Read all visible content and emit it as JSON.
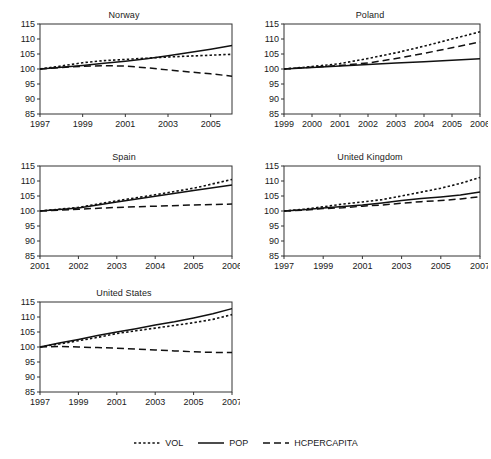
{
  "figure": {
    "width": 491,
    "height": 459,
    "background": "#ffffff",
    "line_color": "#111111",
    "axis_color": "#333333"
  },
  "legend": {
    "position": "bottom-center",
    "entries": [
      {
        "label": "VOL",
        "style": "dotted",
        "name": "legend-vol"
      },
      {
        "label": "POP",
        "style": "solid",
        "name": "legend-pop"
      },
      {
        "label": "HCPERCAPITA",
        "style": "dashed",
        "name": "legend-hcpercapita"
      }
    ]
  },
  "chart_data": {
    "type": "line",
    "title": "",
    "xlabel": "",
    "ylabel": "",
    "ylim": [
      85,
      115
    ],
    "yticks": [
      85,
      90,
      95,
      100,
      105,
      110,
      115
    ],
    "grid": false,
    "legend_position": "bottom-center",
    "panels": [
      {
        "title": "Norway",
        "xlim": [
          1997,
          2006
        ],
        "xticks": [
          1997,
          1999,
          2001,
          2003,
          2005
        ],
        "x": [
          1997,
          1998,
          1999,
          2000,
          2001,
          2002,
          2003,
          2004,
          2005,
          2006
        ],
        "series": [
          {
            "name": "VOL",
            "style": "dotted",
            "values": [
              100.0,
              101.0,
              102.1,
              102.8,
              103.2,
              103.6,
              104.0,
              104.3,
              104.6,
              104.9
            ]
          },
          {
            "name": "POP",
            "style": "solid",
            "values": [
              100.0,
              100.6,
              101.2,
              101.9,
              102.6,
              103.4,
              104.4,
              105.5,
              106.6,
              107.8
            ]
          },
          {
            "name": "HCPERCAPITA",
            "style": "dashed",
            "values": [
              100.0,
              100.5,
              100.9,
              101.1,
              101.0,
              100.4,
              99.7,
              99.0,
              98.4,
              97.6
            ]
          }
        ]
      },
      {
        "title": "Poland",
        "xlim": [
          1999,
          2006
        ],
        "xticks": [
          1999,
          2000,
          2001,
          2002,
          2003,
          2004,
          2005,
          2006
        ],
        "x": [
          1999,
          2000,
          2001,
          2002,
          2003,
          2004,
          2005,
          2006
        ],
        "series": [
          {
            "name": "VOL",
            "style": "dotted",
            "values": [
              100.0,
              100.8,
              101.8,
              103.5,
              105.4,
              107.6,
              110.0,
              112.4
            ]
          },
          {
            "name": "POP",
            "style": "solid",
            "values": [
              100.0,
              100.5,
              101.0,
              101.5,
              102.0,
              102.4,
              102.9,
              103.4
            ]
          },
          {
            "name": "HCPERCAPITA",
            "style": "dashed",
            "values": [
              100.0,
              100.6,
              101.2,
              102.0,
              103.5,
              105.2,
              107.1,
              109.0
            ]
          }
        ]
      },
      {
        "title": "Spain",
        "xlim": [
          2001,
          2006
        ],
        "xticks": [
          2001,
          2002,
          2003,
          2004,
          2005,
          2006
        ],
        "x": [
          2001,
          2002,
          2003,
          2004,
          2005,
          2006
        ],
        "series": [
          {
            "name": "VOL",
            "style": "dotted",
            "values": [
              100.0,
              101.2,
              103.4,
              105.4,
              107.6,
              110.5
            ]
          },
          {
            "name": "POP",
            "style": "solid",
            "values": [
              100.0,
              101.0,
              103.0,
              104.9,
              106.8,
              108.7
            ]
          },
          {
            "name": "HCPERCAPITA",
            "style": "dashed",
            "values": [
              100.0,
              100.6,
              101.2,
              101.6,
              102.0,
              102.3
            ]
          }
        ]
      },
      {
        "title": "United Kingdom",
        "xlim": [
          1997,
          2007
        ],
        "xticks": [
          1997,
          1999,
          2001,
          2003,
          2005,
          2007
        ],
        "x": [
          1997,
          1998,
          1999,
          2000,
          2001,
          2002,
          2003,
          2004,
          2005,
          2006,
          2007
        ],
        "series": [
          {
            "name": "VOL",
            "style": "dotted",
            "values": [
              100.0,
              100.6,
              101.4,
              102.3,
              103.0,
              103.8,
              105.0,
              106.3,
              107.6,
              109.2,
              111.2
            ]
          },
          {
            "name": "POP",
            "style": "solid",
            "values": [
              100.0,
              100.4,
              101.0,
              101.5,
              102.0,
              102.7,
              103.5,
              104.2,
              104.7,
              105.3,
              106.3
            ]
          },
          {
            "name": "HCPERCAPITA",
            "style": "dashed",
            "values": [
              100.0,
              100.3,
              100.8,
              101.1,
              101.6,
              102.0,
              102.6,
              103.1,
              103.5,
              104.0,
              104.8
            ]
          }
        ]
      },
      {
        "title": "United States",
        "xlim": [
          1997,
          2007
        ],
        "xticks": [
          1997,
          1999,
          2001,
          2003,
          2005,
          2007
        ],
        "x": [
          1997,
          1998,
          1999,
          2000,
          2001,
          2002,
          2003,
          2004,
          2005,
          2006,
          2007
        ],
        "series": [
          {
            "name": "VOL",
            "style": "dotted",
            "values": [
              100.0,
              101.0,
              102.1,
              103.2,
              104.5,
              105.4,
              106.3,
              107.2,
              108.1,
              109.2,
              110.8
            ]
          },
          {
            "name": "POP",
            "style": "solid",
            "values": [
              100.0,
              101.3,
              102.5,
              103.8,
              105.0,
              106.1,
              107.3,
              108.4,
              109.7,
              111.1,
              112.8
            ]
          },
          {
            "name": "HCPERCAPITA",
            "style": "dashed",
            "values": [
              100.0,
              100.2,
              100.0,
              99.8,
              99.6,
              99.3,
              99.0,
              98.7,
              98.4,
              98.2,
              98.2
            ]
          }
        ]
      }
    ]
  }
}
